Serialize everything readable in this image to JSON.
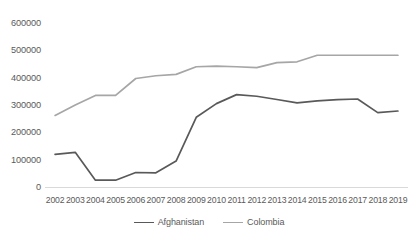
{
  "chart_data": {
    "type": "line",
    "title": "",
    "subtitle": "",
    "xlabel": "",
    "ylabel": "",
    "categories": [
      "2002",
      "2003",
      "2004",
      "2005",
      "2006",
      "2007",
      "2008",
      "2009",
      "2010",
      "2011",
      "2012",
      "2013",
      "2014",
      "2015",
      "2016",
      "2017",
      "2018",
      "2019"
    ],
    "x": [
      2002,
      2003,
      2004,
      2005,
      2006,
      2007,
      2008,
      2009,
      2010,
      2011,
      2012,
      2013,
      2014,
      2015,
      2016,
      2017,
      2018,
      2019
    ],
    "series": [
      {
        "name": "Afghanistan",
        "color": "#595959",
        "values": [
          119000,
          127000,
          25000,
          25000,
          53000,
          52000,
          95000,
          255000,
          305000,
          338000,
          332000,
          320000,
          308000,
          315000,
          320000,
          322000,
          272000,
          278000
        ]
      },
      {
        "name": "Colombia",
        "color": "#a6a6a6",
        "values": [
          262000,
          300000,
          335000,
          335000,
          397000,
          407000,
          412000,
          440000,
          442000,
          440000,
          437000,
          455000,
          458000,
          482000,
          482000,
          482000,
          482000,
          482000
        ]
      }
    ],
    "ylim": [
      0,
      600000
    ],
    "yticks": [
      0,
      100000,
      200000,
      300000,
      400000,
      500000,
      600000
    ],
    "ytick_labels": [
      "0",
      "100000",
      "200000",
      "300000",
      "400000",
      "500000",
      "600000"
    ],
    "grid": false,
    "legend_position": "bottom",
    "annotations": []
  },
  "legend": {
    "items": [
      {
        "label": "Afghanistan",
        "color": "#595959"
      },
      {
        "label": "Colombia",
        "color": "#a6a6a6"
      }
    ]
  }
}
